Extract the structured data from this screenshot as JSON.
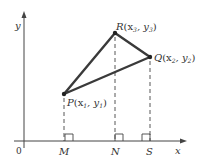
{
  "diagram": {
    "axes": {
      "x_label": "x",
      "y_label": "y",
      "origin_label": "0"
    },
    "points": {
      "P": {
        "letter": "P",
        "coords": "(x",
        "sub1": "1",
        "mid": ", y",
        "sub2": "1",
        "close": ")"
      },
      "Q": {
        "letter": "Q",
        "coords": "(x",
        "sub1": "2",
        "mid": ", y",
        "sub2": "2",
        "close": ")"
      },
      "R": {
        "letter": "R",
        "coords": "(x",
        "sub1": "3",
        "mid": ", y",
        "sub2": "3",
        "close": ")"
      }
    },
    "foot_labels": {
      "M": "M",
      "N": "N",
      "S": "S"
    },
    "colors": {
      "line": "#3a3a3a",
      "dash": "#444444",
      "text": "#333333"
    }
  }
}
